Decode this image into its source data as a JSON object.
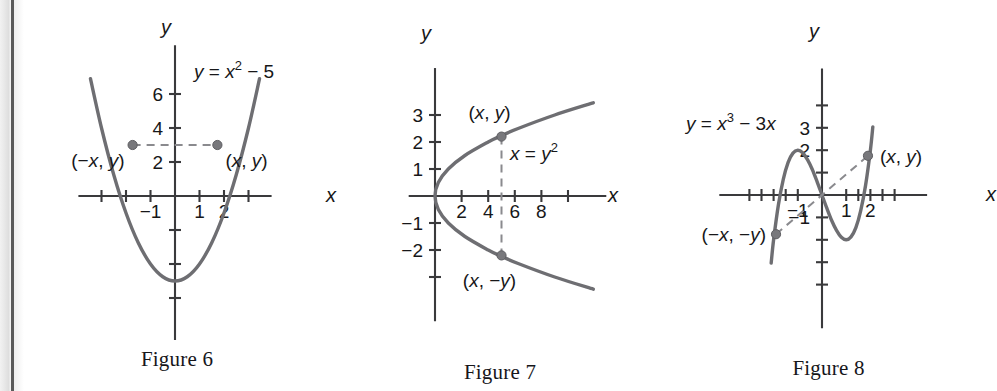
{
  "page": {
    "background": "#ffffff",
    "curve_color": "#6e6e72",
    "axis_color": "#3a3a3c",
    "dash_color": "#8a8a8e",
    "point_color": "#78787c",
    "text_color": "#171719"
  },
  "figures": [
    {
      "id": "figure-6",
      "caption": "Figure 6",
      "equation_parts": {
        "lhs": "y = x",
        "exponent": "2",
        "rhs": " − 5"
      },
      "equation_text": "y = x2 − 5",
      "axis_x_label": "x",
      "axis_y_label": "y",
      "x_tick_labels": [
        "−1",
        "1",
        "2"
      ],
      "y_tick_labels": [
        "6",
        "4",
        "2"
      ],
      "point_labels": {
        "left": "(−x, y)",
        "right": "(x, y)"
      },
      "chart_data": {
        "type": "line",
        "title": "y = x² − 5",
        "xlabel": "x",
        "ylabel": "y",
        "xlim": [
          -3.6,
          3.6
        ],
        "ylim": [
          -7.2,
          8.6
        ],
        "grid": false,
        "legend": "none",
        "x_ticks": [
          -3,
          -2,
          -1,
          1,
          2,
          3
        ],
        "x_ticks_labeled": [
          -1,
          1,
          2
        ],
        "y_ticks": [
          -6,
          -4,
          -2,
          2,
          4,
          6
        ],
        "y_ticks_labeled": [
          2,
          4,
          6
        ],
        "function": "y = x^2 - 5",
        "x": [
          -3.45,
          -3.0,
          -2.5,
          -2.0,
          -1.5,
          -1.0,
          -0.5,
          0,
          0.5,
          1.0,
          1.5,
          2.0,
          2.5,
          3.0,
          3.45
        ],
        "y": [
          6.9,
          4.0,
          1.25,
          -1.0,
          -2.75,
          -4.0,
          -4.75,
          -5.0,
          -4.75,
          -4.0,
          -2.75,
          -1.0,
          1.25,
          4.0,
          6.9
        ],
        "annotations": [
          {
            "label": "(−x, y)",
            "x": -1.73,
            "y": 3.0,
            "marker": true
          },
          {
            "label": "(x, y)",
            "x": 1.73,
            "y": 3.0,
            "marker": true
          }
        ],
        "dashed_segments": [
          {
            "x1": -1.73,
            "y1": 3.0,
            "x2": 1.73,
            "y2": 3.0
          }
        ]
      }
    },
    {
      "id": "figure-7",
      "caption": "Figure 7",
      "equation_parts": {
        "lhs": "x = y",
        "exponent": "2",
        "rhs": ""
      },
      "equation_text": "x = y2",
      "axis_x_label": "x",
      "axis_y_label": "y",
      "x_tick_labels": [
        "2",
        "4",
        "6",
        "8"
      ],
      "y_tick_labels": [
        "3",
        "2",
        "1",
        "−1",
        "−2"
      ],
      "point_labels": {
        "upper": "(x, y)",
        "lower": "(x, −y)"
      },
      "chart_data": {
        "type": "line",
        "title": "x = y²",
        "xlabel": "x",
        "ylabel": "y",
        "xlim": [
          -2.2,
          12.6
        ],
        "ylim": [
          -4.1,
          4.3
        ],
        "grid": false,
        "legend": "none",
        "x_ticks": [
          2,
          4,
          6,
          8,
          10
        ],
        "x_ticks_labeled": [
          2,
          4,
          6,
          8
        ],
        "y_ticks": [
          -3,
          -2,
          -1,
          1,
          2,
          3
        ],
        "y_ticks_labeled": [
          -2,
          -1,
          1,
          2,
          3
        ],
        "function": "x = y^2",
        "y": [
          -3.45,
          -3.0,
          -2.5,
          -2.2,
          -2.0,
          -1.5,
          -1.0,
          -0.5,
          0,
          0.5,
          1.0,
          1.5,
          2.0,
          2.2,
          2.5,
          3.0,
          3.45
        ],
        "x": [
          11.9,
          9.0,
          6.25,
          4.84,
          4.0,
          2.25,
          1.0,
          0.25,
          0,
          0.25,
          1.0,
          2.25,
          4.0,
          4.84,
          6.25,
          9.0,
          11.9
        ],
        "annotations": [
          {
            "label": "(x, y)",
            "x": 5.0,
            "y": 2.2,
            "marker": true
          },
          {
            "label": "(x, −y)",
            "x": 5.0,
            "y": -2.2,
            "marker": true
          }
        ],
        "dashed_segments": [
          {
            "x1": 5.0,
            "y1": 2.2,
            "x2": 5.0,
            "y2": -2.2
          }
        ]
      }
    },
    {
      "id": "figure-8",
      "caption": "Figure 8",
      "equation_parts": {
        "lhs": "y = x",
        "exponent": "3",
        "rhs": " − 3x"
      },
      "equation_text": "y = x3 − 3x",
      "axis_x_label": "x",
      "axis_y_label": "y",
      "x_tick_labels": [
        "−1",
        "1",
        "2"
      ],
      "y_tick_labels": [
        "3",
        "2",
        "−1"
      ],
      "point_labels": {
        "upper": "(x, y)",
        "lower": "(−x, −y)"
      },
      "chart_data": {
        "type": "line",
        "title": "y = x³ − 3x",
        "xlabel": "x",
        "ylabel": "y",
        "xlim": [
          -3.7,
          3.7
        ],
        "ylim": [
          -5.4,
          5.2
        ],
        "grid": false,
        "legend": "none",
        "x_ticks": [
          -3,
          -2.5,
          -2,
          -1.5,
          -1,
          1,
          1.5,
          2,
          2.5,
          3
        ],
        "x_ticks_labeled": [
          -1,
          1,
          2
        ],
        "y_ticks": [
          -4,
          -3,
          -2,
          -1,
          1,
          2,
          3,
          4
        ],
        "y_ticks_labeled": [
          -1,
          2,
          3
        ],
        "function": "y = x^3 - 3x",
        "x": [
          -2.1,
          -2.0,
          -1.8,
          -1.6,
          -1.4,
          -1.2,
          -1.0,
          -0.8,
          -0.6,
          -0.4,
          -0.2,
          0,
          0.2,
          0.4,
          0.6,
          0.8,
          1.0,
          1.2,
          1.4,
          1.6,
          1.8,
          2.0,
          2.1
        ],
        "y": [
          -3.04,
          -2.0,
          -0.43,
          0.7,
          1.46,
          1.87,
          2.0,
          1.89,
          1.58,
          1.14,
          0.59,
          0,
          -0.59,
          -1.14,
          -1.58,
          -1.89,
          -2.0,
          -1.87,
          -1.46,
          -0.7,
          0.43,
          2.0,
          3.04
        ],
        "annotations": [
          {
            "label": "(x, y)",
            "x": 1.9,
            "y": 1.75,
            "marker": true
          },
          {
            "label": "(−x, −y)",
            "x": -1.9,
            "y": -1.75,
            "marker": true
          }
        ],
        "dashed_segments": [
          {
            "x1": -1.9,
            "y1": -1.75,
            "x2": 1.9,
            "y2": 1.75
          }
        ]
      }
    }
  ]
}
